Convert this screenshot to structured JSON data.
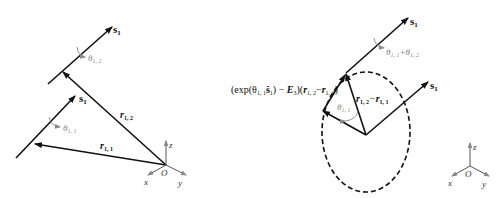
{
  "left_diagram": {
    "upper_axis_label": "s",
    "upper_axis_sub": "1",
    "upper_angle_label": "θ",
    "upper_angle_sub": "1, 2",
    "lower_axis_label": "s",
    "lower_axis_sub": "1",
    "lower_angle_label": "θ",
    "lower_angle_sub": "1, 1",
    "vec_r12": "r",
    "vec_r12_sub": "1, 2",
    "vec_r11": "r",
    "vec_r11_sub": "1, 1",
    "axes": {
      "x": "x",
      "y": "y",
      "z": "z",
      "origin": "O"
    }
  },
  "right_diagram": {
    "upper_axis_label": "s",
    "upper_axis_sub": "1",
    "upper_angle_label": "θ",
    "upper_angle_sub_a": "1, 1",
    "upper_angle_plus": "+θ",
    "upper_angle_sub_b": "1, 2",
    "right_axis_label": "s",
    "right_axis_sub": "1",
    "inner_angle_label": "θ",
    "inner_angle_sub": "1, 1",
    "diff_vec_a": "r",
    "diff_vec_a_sub": "1, 2",
    "diff_minus": "−",
    "diff_vec_b": "r",
    "diff_vec_b_sub": "1, 1",
    "expression": {
      "open": "(exp(θ",
      "sub1": "1, 1",
      "s_hat": "ŝ",
      "s_hat_sub": "1",
      "close_minus": ") − ",
      "E": "E",
      "E_sub": "3",
      "paren": ")(",
      "r1": "r",
      "r1_sub": "1, 2",
      "minus": "−",
      "r2": "r",
      "r2_sub": "1, 1",
      "end": ")"
    },
    "axes": {
      "x": "x",
      "y": "y",
      "z": "z",
      "origin": "O"
    }
  },
  "colors": {
    "line": "#111111",
    "annotation": "#8a8a8a",
    "background": "#ffffff"
  }
}
